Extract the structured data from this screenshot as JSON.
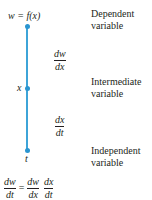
{
  "diagram": {
    "type": "chain-rule-dependency",
    "nodes": [
      {
        "label": "w = f(x)",
        "role": "Dependent",
        "role2": "variable"
      },
      {
        "label": "x",
        "role": "Intermediate",
        "role2": "variable"
      },
      {
        "label": "t",
        "role": "Independent",
        "role2": "variable"
      }
    ],
    "edges": [
      {
        "num": "dw",
        "den": "dx"
      },
      {
        "num": "dx",
        "den": "dt"
      }
    ],
    "equation": {
      "lhs": {
        "num": "dw",
        "den": "dt"
      },
      "equals": "=",
      "rhs1": {
        "num": "dw",
        "den": "dx"
      },
      "rhs2": {
        "num": "dx",
        "den": "dt"
      }
    },
    "colors": {
      "line": "#3ea4d8",
      "dot": "#2a95d0",
      "text": "#231f20"
    }
  }
}
